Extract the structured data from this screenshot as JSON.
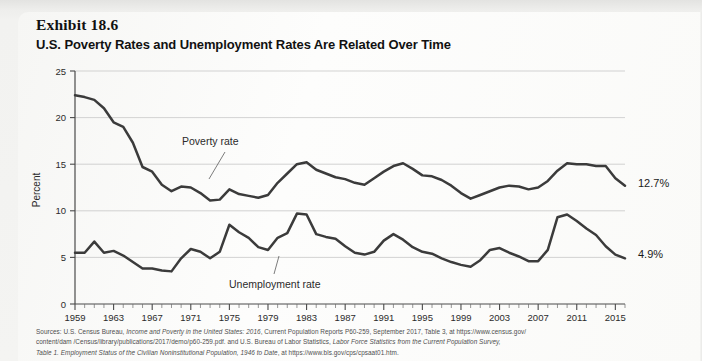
{
  "exhibit": {
    "label": "Exhibit 18.6",
    "title": "U.S. Poverty Rates and Unemployment Rates Are Related Over Time"
  },
  "annotations": {
    "poverty_label": "Poverty rate",
    "unemployment_label": "Unemployment  rate",
    "poverty_end_value": "12.7%",
    "unemployment_end_value": "4.9%"
  },
  "sources": {
    "line1_a": "Sources: U.S. Census Bureau, ",
    "line1_it": "Income and Poverty in the United States: 2016",
    "line1_b": ", Current Population Reports P60-259, September 2017, Table 3, at https://www.census.gov/",
    "line2_a": "content/dam /Census/library/publications/2017/demo/p60-259.pdf. and U.S. Bureau of Labor Statistics, ",
    "line2_it": "Labor Force Statistics from the Current Population Survey,",
    "line3_it": "Table 1. Employment Status of the Civilian Noninstitutional Population, 1946 to Date",
    "line3_b": ", at https://www.bls.gov/cps/cpsaat01.htm."
  },
  "chart_data": {
    "type": "line",
    "title": "U.S. Poverty Rates and Unemployment Rates Are Related Over Time",
    "xlabel": "",
    "ylabel": "Percent",
    "ylim": [
      0,
      25
    ],
    "yticks": [
      0,
      5,
      10,
      15,
      20,
      25
    ],
    "xlim": [
      1959,
      2016
    ],
    "xticks": [
      1959,
      1963,
      1967,
      1971,
      1975,
      1979,
      1983,
      1987,
      1991,
      1995,
      1999,
      2003,
      2007,
      2011,
      2015
    ],
    "minor_x_tick_step": 1,
    "grid": "horizontal",
    "legend": "annotated-inline",
    "x": [
      1959,
      1960,
      1961,
      1962,
      1963,
      1964,
      1965,
      1966,
      1967,
      1968,
      1969,
      1970,
      1971,
      1972,
      1973,
      1974,
      1975,
      1976,
      1977,
      1978,
      1979,
      1980,
      1981,
      1982,
      1983,
      1984,
      1985,
      1986,
      1987,
      1988,
      1989,
      1990,
      1991,
      1992,
      1993,
      1994,
      1995,
      1996,
      1997,
      1998,
      1999,
      2000,
      2001,
      2002,
      2003,
      2004,
      2005,
      2006,
      2007,
      2008,
      2009,
      2010,
      2011,
      2012,
      2013,
      2014,
      2015,
      2016
    ],
    "series": [
      {
        "name": "Poverty rate",
        "color": "#3b3b3b",
        "end_label": "12.7%",
        "values": [
          22.4,
          22.2,
          21.9,
          21.0,
          19.5,
          19.0,
          17.3,
          14.7,
          14.2,
          12.8,
          12.1,
          12.6,
          12.5,
          11.9,
          11.1,
          11.2,
          12.3,
          11.8,
          11.6,
          11.4,
          11.7,
          13.0,
          14.0,
          15.0,
          15.2,
          14.4,
          14.0,
          13.6,
          13.4,
          13.0,
          12.8,
          13.5,
          14.2,
          14.8,
          15.1,
          14.5,
          13.8,
          13.7,
          13.3,
          12.7,
          11.9,
          11.3,
          11.7,
          12.1,
          12.5,
          12.7,
          12.6,
          12.3,
          12.5,
          13.2,
          14.3,
          15.1,
          15.0,
          15.0,
          14.8,
          14.8,
          13.5,
          12.7
        ]
      },
      {
        "name": "Unemployment rate",
        "color": "#3b3b3b",
        "end_label": "4.9%",
        "values": [
          5.5,
          5.5,
          6.7,
          5.5,
          5.7,
          5.2,
          4.5,
          3.8,
          3.8,
          3.6,
          3.5,
          4.9,
          5.9,
          5.6,
          4.9,
          5.6,
          8.5,
          7.7,
          7.1,
          6.1,
          5.8,
          7.1,
          7.6,
          9.7,
          9.6,
          7.5,
          7.2,
          7.0,
          6.2,
          5.5,
          5.3,
          5.6,
          6.8,
          7.5,
          6.9,
          6.1,
          5.6,
          5.4,
          4.9,
          4.5,
          4.2,
          4.0,
          4.7,
          5.8,
          6.0,
          5.5,
          5.1,
          4.6,
          4.6,
          5.8,
          9.3,
          9.6,
          8.9,
          8.1,
          7.4,
          6.2,
          5.3,
          4.9
        ]
      }
    ]
  }
}
